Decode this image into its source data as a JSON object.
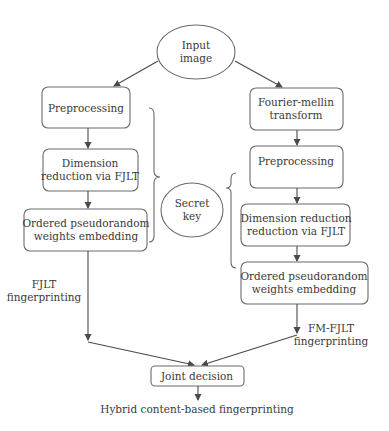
{
  "diagram": {
    "type": "flowchart",
    "colors": {
      "stroke": "#6b6b6b",
      "text": "#3a3a3a",
      "background": "#ffffff"
    },
    "nodes": {
      "input": {
        "shape": "ellipse",
        "line1": "Input",
        "line2": "image"
      },
      "secret_key": {
        "shape": "ellipse",
        "line1": "Secret",
        "line2": "key"
      },
      "left": {
        "preprocessing": {
          "label": "Preprocessing"
        },
        "dimension": {
          "line1": "Dimension",
          "line2": "reduction via FJLT"
        },
        "ordered": {
          "line1": "Ordered pseudorandom",
          "line2": "weights embedding"
        }
      },
      "right": {
        "fourier": {
          "line1": "Fourier-mellin",
          "line2": "transform"
        },
        "preprocessing": {
          "label": "Preprocessing"
        },
        "dimension": {
          "line1": "Dimension reduction",
          "line2": "reduction via FJLT"
        },
        "ordered": {
          "line1": "Ordered pseudorandom",
          "line2": "weights embedding"
        }
      },
      "joint": {
        "label": "Joint decision"
      }
    },
    "edge_labels": {
      "left": {
        "line1": "FJLT",
        "line2": "fingerprinting"
      },
      "right": {
        "line1": "FM-FJLT",
        "line2": "fingerprinting"
      }
    },
    "output": {
      "label": "Hybrid content-based fingerprinting"
    }
  }
}
